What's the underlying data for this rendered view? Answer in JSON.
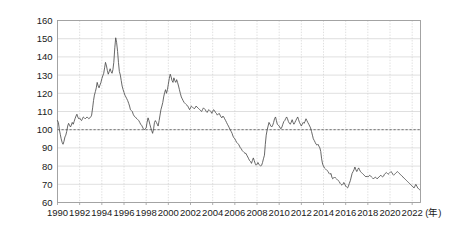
{
  "chart_data": {
    "type": "line",
    "title": "",
    "subtitle": "",
    "xlabel": "",
    "ylabel": "",
    "unit_note": "(年)",
    "xlim": [
      1990,
      2022.75
    ],
    "ylim": [
      60,
      160
    ],
    "y_ticks": [
      60,
      70,
      80,
      90,
      100,
      110,
      120,
      130,
      140,
      150,
      160
    ],
    "x_ticks": [
      1990,
      1992,
      1994,
      1996,
      1998,
      2000,
      2002,
      2004,
      2006,
      2008,
      2010,
      2012,
      2014,
      2016,
      2018,
      2020,
      2022
    ],
    "grid": {
      "horizontal": true,
      "vertical": true,
      "vertical_style": "dotted"
    },
    "legend": {
      "show": false,
      "position": "none"
    },
    "annotations": [
      {
        "type": "hline",
        "value": 100,
        "style": "dashed",
        "label": ""
      }
    ],
    "series": [
      {
        "name": "Index",
        "color": "#4d4d4d",
        "x": [
          1990.0,
          1990.08,
          1990.17,
          1990.25,
          1990.33,
          1990.42,
          1990.5,
          1990.58,
          1990.67,
          1990.75,
          1990.83,
          1990.92,
          1991.0,
          1991.08,
          1991.17,
          1991.25,
          1991.33,
          1991.42,
          1991.5,
          1991.58,
          1991.67,
          1991.75,
          1991.83,
          1991.92,
          1992.0,
          1992.08,
          1992.17,
          1992.25,
          1992.33,
          1992.42,
          1992.5,
          1992.58,
          1992.67,
          1992.75,
          1992.83,
          1992.92,
          1993.0,
          1993.08,
          1993.17,
          1993.25,
          1993.33,
          1993.42,
          1993.5,
          1993.58,
          1993.67,
          1993.75,
          1993.83,
          1993.92,
          1994.0,
          1994.08,
          1994.17,
          1994.25,
          1994.33,
          1994.42,
          1994.5,
          1994.58,
          1994.67,
          1994.75,
          1994.83,
          1994.92,
          1995.0,
          1995.08,
          1995.17,
          1995.25,
          1995.33,
          1995.42,
          1995.5,
          1995.58,
          1995.67,
          1995.75,
          1995.83,
          1995.92,
          1996.0,
          1996.08,
          1996.17,
          1996.25,
          1996.33,
          1996.42,
          1996.5,
          1996.58,
          1996.67,
          1996.75,
          1996.83,
          1996.92,
          1997.0,
          1997.08,
          1997.17,
          1997.25,
          1997.33,
          1997.42,
          1997.5,
          1997.58,
          1997.67,
          1997.75,
          1997.83,
          1997.92,
          1998.0,
          1998.08,
          1998.17,
          1998.25,
          1998.33,
          1998.42,
          1998.5,
          1998.58,
          1998.67,
          1998.75,
          1998.83,
          1998.92,
          1999.0,
          1999.08,
          1999.17,
          1999.25,
          1999.33,
          1999.42,
          1999.5,
          1999.58,
          1999.67,
          1999.75,
          1999.83,
          1999.92,
          2000.0,
          2000.08,
          2000.17,
          2000.25,
          2000.33,
          2000.42,
          2000.5,
          2000.58,
          2000.67,
          2000.75,
          2000.83,
          2000.92,
          2001.0,
          2001.08,
          2001.17,
          2001.25,
          2001.33,
          2001.42,
          2001.5,
          2001.58,
          2001.67,
          2001.75,
          2001.83,
          2001.92,
          2002.0,
          2002.08,
          2002.17,
          2002.25,
          2002.33,
          2002.42,
          2002.5,
          2002.58,
          2002.67,
          2002.75,
          2002.83,
          2002.92,
          2003.0,
          2003.08,
          2003.17,
          2003.25,
          2003.33,
          2003.42,
          2003.5,
          2003.58,
          2003.67,
          2003.75,
          2003.83,
          2003.92,
          2004.0,
          2004.08,
          2004.17,
          2004.25,
          2004.33,
          2004.42,
          2004.5,
          2004.58,
          2004.67,
          2004.75,
          2004.83,
          2004.92,
          2005.0,
          2005.08,
          2005.17,
          2005.25,
          2005.33,
          2005.42,
          2005.5,
          2005.58,
          2005.67,
          2005.75,
          2005.83,
          2005.92,
          2006.0,
          2006.08,
          2006.17,
          2006.25,
          2006.33,
          2006.42,
          2006.5,
          2006.58,
          2006.67,
          2006.75,
          2006.83,
          2006.92,
          2007.0,
          2007.08,
          2007.17,
          2007.25,
          2007.33,
          2007.42,
          2007.5,
          2007.58,
          2007.67,
          2007.75,
          2007.83,
          2007.92,
          2008.0,
          2008.08,
          2008.17,
          2008.25,
          2008.33,
          2008.42,
          2008.5,
          2008.58,
          2008.67,
          2008.75,
          2008.83,
          2008.92,
          2009.0,
          2009.08,
          2009.17,
          2009.25,
          2009.33,
          2009.42,
          2009.5,
          2009.58,
          2009.67,
          2009.75,
          2009.83,
          2009.92,
          2010.0,
          2010.08,
          2010.17,
          2010.25,
          2010.33,
          2010.42,
          2010.5,
          2010.58,
          2010.67,
          2010.75,
          2010.83,
          2010.92,
          2011.0,
          2011.08,
          2011.17,
          2011.25,
          2011.33,
          2011.42,
          2011.5,
          2011.58,
          2011.67,
          2011.75,
          2011.83,
          2011.92,
          2012.0,
          2012.08,
          2012.17,
          2012.25,
          2012.33,
          2012.42,
          2012.5,
          2012.58,
          2012.67,
          2012.75,
          2012.83,
          2012.92,
          2013.0,
          2013.08,
          2013.17,
          2013.25,
          2013.33,
          2013.42,
          2013.5,
          2013.58,
          2013.67,
          2013.75,
          2013.83,
          2013.92,
          2014.0,
          2014.08,
          2014.17,
          2014.25,
          2014.33,
          2014.42,
          2014.5,
          2014.58,
          2014.67,
          2014.75,
          2014.83,
          2014.92,
          2015.0,
          2015.08,
          2015.17,
          2015.25,
          2015.33,
          2015.42,
          2015.5,
          2015.58,
          2015.67,
          2015.75,
          2015.83,
          2015.92,
          2016.0,
          2016.08,
          2016.17,
          2016.25,
          2016.33,
          2016.42,
          2016.5,
          2016.58,
          2016.67,
          2016.75,
          2016.83,
          2016.92,
          2017.0,
          2017.08,
          2017.17,
          2017.25,
          2017.33,
          2017.42,
          2017.5,
          2017.58,
          2017.67,
          2017.75,
          2017.83,
          2017.92,
          2018.0,
          2018.08,
          2018.17,
          2018.25,
          2018.33,
          2018.42,
          2018.5,
          2018.58,
          2018.67,
          2018.75,
          2018.83,
          2018.92,
          2019.0,
          2019.08,
          2019.17,
          2019.25,
          2019.33,
          2019.42,
          2019.5,
          2019.58,
          2019.67,
          2019.75,
          2019.83,
          2019.92,
          2020.0,
          2020.08,
          2020.17,
          2020.25,
          2020.33,
          2020.42,
          2020.5,
          2020.58,
          2020.67,
          2020.75,
          2020.83,
          2020.92,
          2021.0,
          2021.08,
          2021.17,
          2021.25,
          2021.33,
          2021.42,
          2021.5,
          2021.58,
          2021.67,
          2021.75,
          2021.83,
          2021.92,
          2022.0,
          2022.08,
          2022.17,
          2022.25,
          2022.33,
          2022.42,
          2022.5,
          2022.58,
          2022.67
        ],
        "values": [
          105.0,
          104.0,
          100.0,
          97.5,
          95.0,
          93.0,
          92.0,
          93.5,
          96.0,
          97.0,
          99.0,
          102.0,
          103.5,
          102.5,
          101.5,
          102.5,
          104.0,
          103.0,
          104.5,
          106.0,
          107.5,
          108.5,
          107.0,
          106.0,
          106.5,
          105.5,
          105.0,
          106.0,
          107.0,
          106.5,
          106.0,
          106.5,
          107.0,
          106.5,
          106.0,
          106.5,
          107.0,
          108.0,
          112.0,
          116.0,
          119.0,
          121.0,
          123.0,
          126.0,
          124.0,
          123.0,
          124.5,
          126.0,
          128.0,
          129.5,
          131.0,
          134.0,
          137.0,
          135.0,
          132.5,
          130.5,
          132.0,
          133.5,
          132.0,
          131.0,
          133.0,
          137.0,
          145.0,
          150.5,
          148.0,
          143.0,
          137.0,
          132.0,
          130.0,
          127.0,
          124.0,
          122.0,
          120.5,
          119.0,
          118.0,
          117.0,
          116.0,
          114.5,
          113.0,
          111.0,
          110.5,
          110.0,
          108.5,
          107.5,
          107.0,
          106.5,
          106.0,
          105.5,
          105.0,
          104.0,
          103.0,
          102.5,
          101.5,
          100.5,
          100.0,
          100.5,
          101.0,
          104.0,
          106.5,
          105.0,
          103.0,
          101.0,
          99.5,
          98.0,
          100.5,
          104.0,
          105.0,
          104.0,
          103.0,
          102.0,
          105.0,
          108.0,
          111.0,
          113.0,
          115.0,
          118.0,
          120.5,
          122.0,
          120.0,
          122.0,
          125.0,
          128.0,
          130.5,
          129.0,
          127.0,
          126.0,
          128.5,
          127.0,
          126.0,
          127.5,
          126.0,
          124.0,
          122.0,
          120.0,
          118.0,
          117.0,
          116.0,
          115.0,
          114.5,
          114.0,
          113.5,
          113.0,
          112.0,
          111.0,
          112.0,
          113.0,
          112.5,
          112.0,
          111.5,
          112.0,
          113.0,
          112.5,
          112.0,
          111.5,
          111.0,
          110.5,
          110.0,
          111.0,
          112.0,
          111.5,
          111.0,
          110.0,
          109.5,
          110.5,
          111.0,
          110.5,
          110.0,
          109.0,
          110.0,
          111.0,
          110.5,
          109.5,
          109.0,
          108.0,
          108.5,
          109.0,
          108.0,
          107.0,
          106.5,
          107.5,
          107.0,
          106.0,
          105.0,
          104.0,
          103.0,
          102.0,
          101.0,
          100.0,
          99.0,
          98.0,
          96.5,
          95.5,
          95.0,
          94.0,
          93.0,
          92.5,
          92.0,
          91.0,
          90.0,
          89.5,
          88.5,
          88.0,
          87.5,
          87.0,
          87.0,
          86.0,
          85.0,
          84.0,
          83.0,
          82.5,
          81.5,
          83.0,
          84.5,
          83.0,
          81.5,
          80.5,
          81.0,
          82.0,
          81.0,
          80.5,
          80.0,
          80.5,
          82.0,
          84.0,
          86.0,
          92.0,
          97.0,
          100.0,
          102.0,
          104.0,
          103.0,
          102.0,
          101.5,
          102.5,
          104.0,
          106.0,
          107.0,
          105.0,
          103.0,
          102.5,
          102.0,
          101.0,
          100.5,
          101.5,
          103.0,
          104.5,
          105.0,
          106.0,
          107.0,
          106.0,
          104.5,
          103.5,
          103.0,
          104.0,
          105.5,
          104.0,
          103.0,
          104.0,
          105.0,
          106.0,
          107.0,
          105.5,
          104.0,
          103.0,
          102.0,
          103.0,
          104.0,
          103.5,
          104.5,
          106.0,
          105.0,
          104.0,
          103.0,
          102.0,
          101.0,
          99.0,
          97.0,
          95.0,
          94.0,
          93.0,
          92.0,
          91.5,
          92.0,
          91.0,
          90.0,
          88.0,
          84.0,
          81.0,
          80.0,
          79.0,
          78.5,
          78.0,
          77.5,
          77.0,
          76.0,
          75.5,
          76.0,
          74.0,
          73.0,
          73.5,
          74.0,
          73.5,
          73.0,
          72.5,
          72.0,
          71.5,
          70.5,
          70.0,
          69.5,
          70.0,
          71.0,
          70.0,
          69.0,
          68.5,
          68.0,
          69.0,
          70.5,
          72.0,
          74.0,
          76.0,
          77.0,
          78.0,
          79.5,
          78.0,
          77.0,
          78.0,
          79.0,
          78.0,
          77.0,
          76.5,
          76.0,
          75.5,
          75.0,
          74.5,
          74.0,
          74.5,
          74.0,
          74.5,
          75.0,
          74.5,
          74.0,
          73.5,
          73.0,
          73.5,
          74.0,
          73.5,
          73.0,
          73.5,
          74.0,
          74.5,
          75.0,
          74.5,
          74.0,
          74.5,
          75.5,
          76.0,
          76.5,
          76.0,
          75.5,
          76.0,
          76.5,
          77.0,
          76.5,
          75.5,
          75.0,
          75.5,
          76.0,
          76.5,
          77.0,
          76.5,
          76.0,
          75.5,
          75.0,
          74.5,
          74.0,
          73.5,
          73.0,
          72.5,
          72.0,
          71.5,
          71.0,
          70.5,
          70.0,
          69.5,
          69.0,
          68.5,
          68.0,
          69.0,
          70.0,
          69.0,
          68.0,
          67.5,
          67.0
        ]
      }
    ]
  }
}
